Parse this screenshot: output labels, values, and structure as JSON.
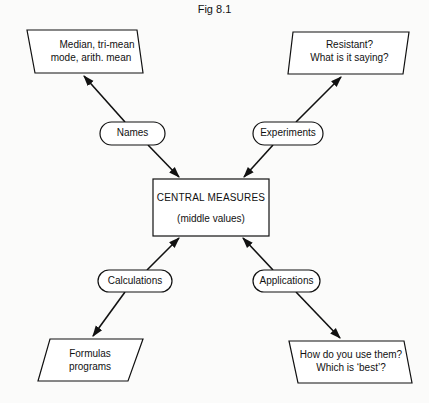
{
  "figure": {
    "title": "Fig 8.1"
  },
  "center": {
    "title": "CENTRAL MEASURES",
    "subtitle": "(middle values)"
  },
  "branches": [
    {
      "id": "names",
      "connector": "Names",
      "leaf_lines": [
        "Median, tri-mean",
        "mode, arith. mean"
      ],
      "position": "top-left"
    },
    {
      "id": "experiments",
      "connector": "Experiments",
      "leaf_lines": [
        "Resistant?",
        "What is it saying?"
      ],
      "position": "top-right"
    },
    {
      "id": "calculations",
      "connector": "Calculations",
      "leaf_lines": [
        "Formulas",
        "programs"
      ],
      "position": "bottom-left"
    },
    {
      "id": "applications",
      "connector": "Applications",
      "leaf_lines": [
        "How do you use them?",
        "Which is ‘best’?"
      ],
      "position": "bottom-right"
    }
  ],
  "colors": {
    "stroke": "#111111",
    "background": "#fbfbfa"
  }
}
